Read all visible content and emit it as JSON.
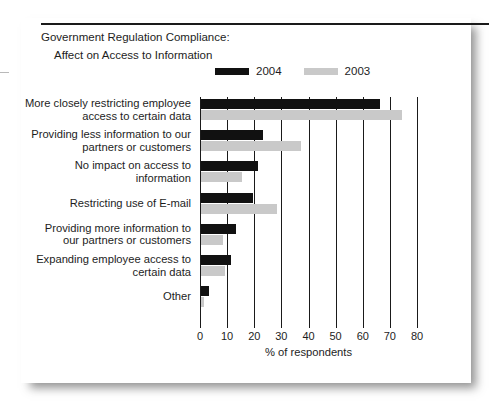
{
  "figure": {
    "title_line1": "Government Regulation Compliance:",
    "title_line2": "Affect on Access to Information",
    "footer_smudge": "                                                                                            "
  },
  "legend": {
    "entries": [
      {
        "label": "2004",
        "color": "#111111",
        "swatch_name": "legend-swatch-2004"
      },
      {
        "label": "2003",
        "color": "#c9c9c9",
        "swatch_name": "legend-swatch-2003"
      }
    ]
  },
  "chart_data": {
    "type": "bar",
    "orientation": "horizontal",
    "title": "Government Regulation Compliance: Affect on Access to Information",
    "xlabel": "% of respondents",
    "ylabel": "",
    "xlim": [
      0,
      80
    ],
    "xticks": [
      0,
      10,
      20,
      30,
      40,
      50,
      60,
      70,
      80
    ],
    "xtick_labels": [
      "0",
      "10",
      "20",
      "30",
      "40",
      "50",
      "60",
      "70",
      "80"
    ],
    "grid": true,
    "legend_position": "top-center",
    "categories": [
      "More closely restricting employee access to certain data",
      "Providing less information to our partners or customers",
      "No impact on access to information",
      "Restricting use of E-mail",
      "Providing more information to our partners or customers",
      "Expanding employee access to certain data",
      "Other"
    ],
    "category_lines": [
      [
        "More closely restricting employee",
        "access to certain data"
      ],
      [
        "Providing less information to our",
        "partners or customers"
      ],
      [
        "No impact on access to",
        "information"
      ],
      [
        "Restricting use of E-mail"
      ],
      [
        "Providing more information to",
        "our partners or customers"
      ],
      [
        "Expanding employee access to",
        "certain data"
      ],
      [
        "Other"
      ]
    ],
    "series": [
      {
        "name": "2004",
        "color": "#111111",
        "values": [
          66,
          23,
          21,
          19,
          13,
          11,
          3
        ]
      },
      {
        "name": "2003",
        "color": "#c9c9c9",
        "values": [
          74,
          37,
          15,
          28,
          8,
          9,
          1
        ]
      }
    ]
  },
  "axis": {
    "x_title": "% of respondents"
  }
}
